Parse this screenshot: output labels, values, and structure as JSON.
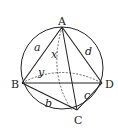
{
  "diagram": {
    "vertices": {
      "A": "A",
      "B": "B",
      "C": "C",
      "D": "D"
    },
    "edges": {
      "a": "a",
      "b": "b",
      "c": "c",
      "d": "d",
      "x": "x",
      "y": "y"
    },
    "colors": {
      "stroke": "#222222",
      "background": "#ffffff"
    }
  }
}
